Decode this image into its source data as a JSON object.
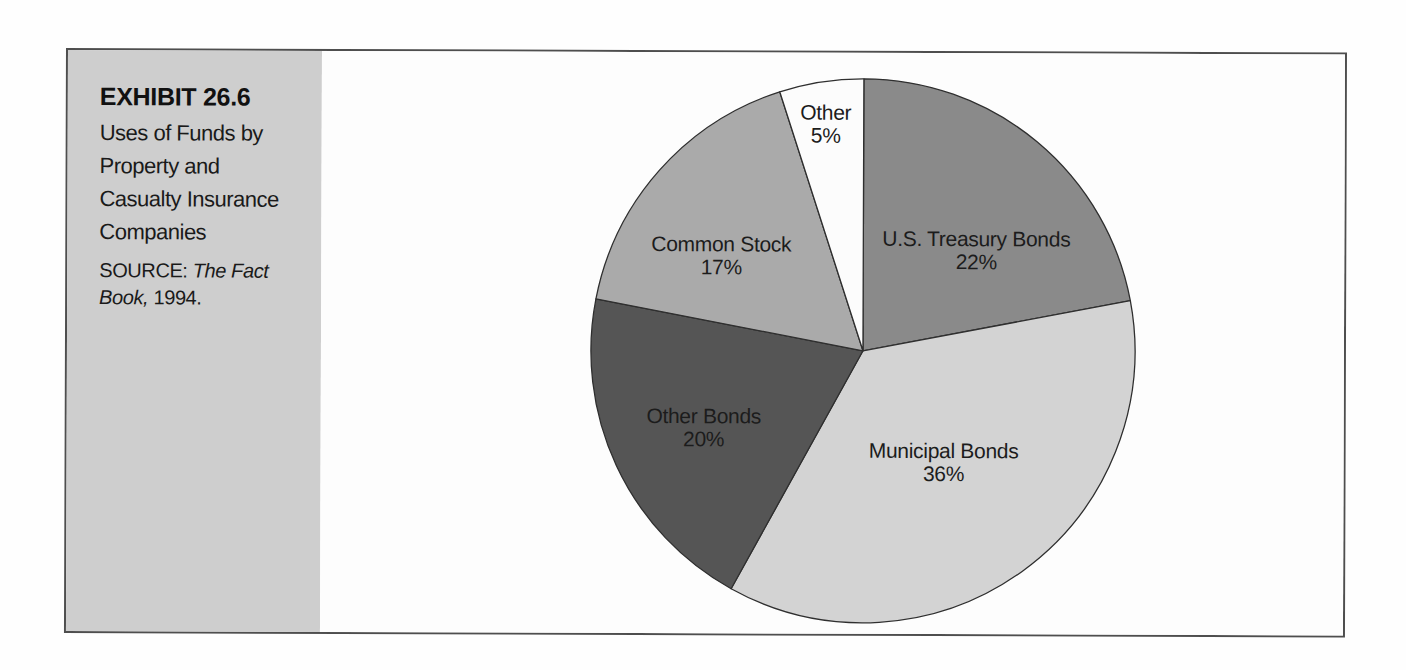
{
  "exhibit": {
    "label": "EXHIBIT 26.6",
    "title_lines": [
      "Uses of Funds by",
      "Property and",
      "Casualty Insurance",
      "Companies"
    ],
    "source": {
      "prefix": "SOURCE:",
      "italic_part1": "The Fact",
      "italic_part2": "Book,",
      "suffix": "1994."
    }
  },
  "chart_data": {
    "type": "pie",
    "title": "Uses of Funds by Property and Casualty Insurance Companies",
    "source": "SOURCE: The Fact Book, 1994.",
    "start_angle_deg": 0,
    "direction": "clockwise",
    "value_suffix": "%",
    "slices": [
      {
        "label": "U.S. Treasury Bonds",
        "pct": 22,
        "color": "#8a8a8a"
      },
      {
        "label": "Municipal Bonds",
        "pct": 36,
        "color": "#d3d3d3"
      },
      {
        "label": "Other Bonds",
        "pct": 20,
        "color": "#555555"
      },
      {
        "label": "Common Stock",
        "pct": 17,
        "color": "#aaaaaa"
      },
      {
        "label": "Other",
        "pct": 5,
        "color": "#fcfcfc"
      }
    ]
  },
  "colors": {
    "sidebar_bg": "#cecece",
    "frame_border": "#4e4e4e",
    "slice_outline": "#2f2f2f",
    "text": "#1c1c1c",
    "page_bg": "#fefefe"
  }
}
